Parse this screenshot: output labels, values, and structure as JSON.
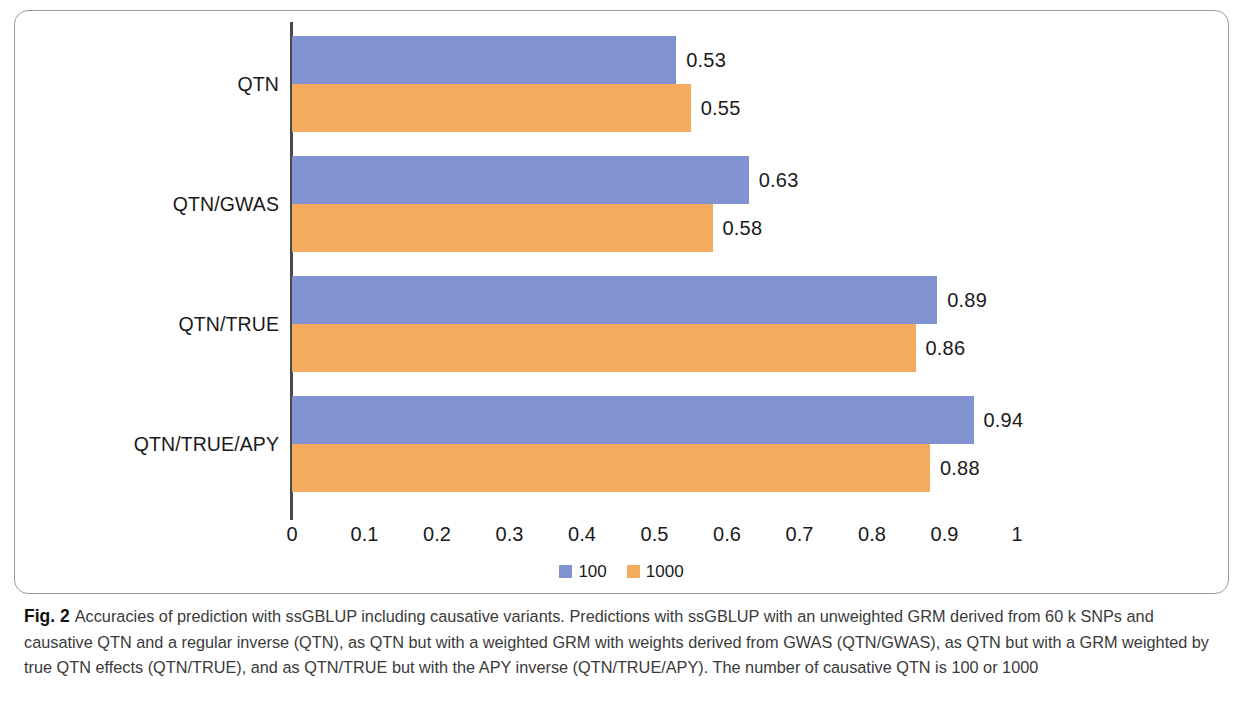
{
  "figure": {
    "label": "Fig. 2",
    "caption": "Accuracies of prediction with ssGBLUP including causative variants. Predictions with ssGBLUP with an unweighted GRM derived from 60 k SNPs and causative QTN and a regular inverse (QTN), as QTN but with a weighted GRM with weights derived from GWAS (QTN/GWAS), as QTN but with a GRM weighted by true QTN effects (QTN/TRUE), and as QTN/TRUE but with the APY inverse (QTN/TRUE/APY). The number of causative QTN is 100 or 1000"
  },
  "colors": {
    "series_100": "#8193d0",
    "series_1000": "#f4ab5d",
    "axis": "#4a4a4a",
    "frame": "#9a9a9a",
    "text": "#1a1a1a"
  },
  "chart_data": {
    "type": "bar",
    "orientation": "horizontal",
    "title": "",
    "xlabel": "",
    "ylabel": "",
    "xlim": [
      0,
      1
    ],
    "grid": false,
    "legend_position": "bottom-center",
    "categories": [
      "QTN",
      "QTN/GWAS",
      "QTN/TRUE",
      "QTN/TRUE/APY"
    ],
    "tick_labels": [
      "0",
      "0.1",
      "0.2",
      "0.3",
      "0.4",
      "0.5",
      "0.6",
      "0.7",
      "0.8",
      "0.9",
      "1"
    ],
    "tick_values": [
      0,
      0.1,
      0.2,
      0.3,
      0.4,
      0.5,
      0.6,
      0.7,
      0.8,
      0.9,
      1
    ],
    "series": [
      {
        "name": "100",
        "color": "#8193d0",
        "values": [
          0.53,
          0.63,
          0.89,
          0.94
        ],
        "labels": [
          "0.53",
          "0.63",
          "0.89",
          "0.94"
        ]
      },
      {
        "name": "1000",
        "color": "#f4ab5d",
        "values": [
          0.55,
          0.58,
          0.86,
          0.88
        ],
        "labels": [
          "0.55",
          "0.58",
          "0.86",
          "0.88"
        ]
      }
    ]
  }
}
